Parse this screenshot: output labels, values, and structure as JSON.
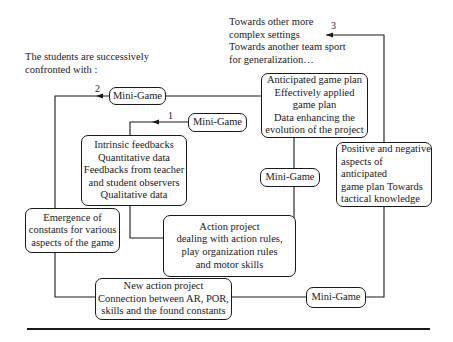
{
  "diagram": {
    "top_note": "Towards other more\ncomplex settings\nTowards another team sport\nfor generalization…",
    "intro_text": "The students are successively\nconfronted with :",
    "loop_labels": {
      "loop1": "1",
      "loop2": "2",
      "loop3": "3"
    },
    "nodes": {
      "mini_game_top": "Mini-Game",
      "anticipated_plan": "Anticipated game plan\nEffectively applied\ngame plan\nData enhancing the\nevolution of the project",
      "mini_game_1": "Mini-Game",
      "intrinsic_feedbacks": "Intrinsic feedbacks\nQuantitative data\nFeedbacks from teacher\nand student observers\nQualitative data",
      "emergence_constants": "Emergence of\nconstants for various\naspects of the game",
      "mini_game_middle": "Mini-Game",
      "positive_negative": "Positive and negative\naspects of anticipated\ngame plan Towards\ntactical knowledge",
      "action_project": "Action project\ndealing with action rules,\nplay organization rules\nand motor skills",
      "new_action_project": "New action project\nConnection between AR, POR,\nskills and the found constants",
      "mini_game_bottom": "Mini-Game"
    },
    "colors": {
      "stroke": "#1a1a1a",
      "background": "#ffffff"
    }
  }
}
